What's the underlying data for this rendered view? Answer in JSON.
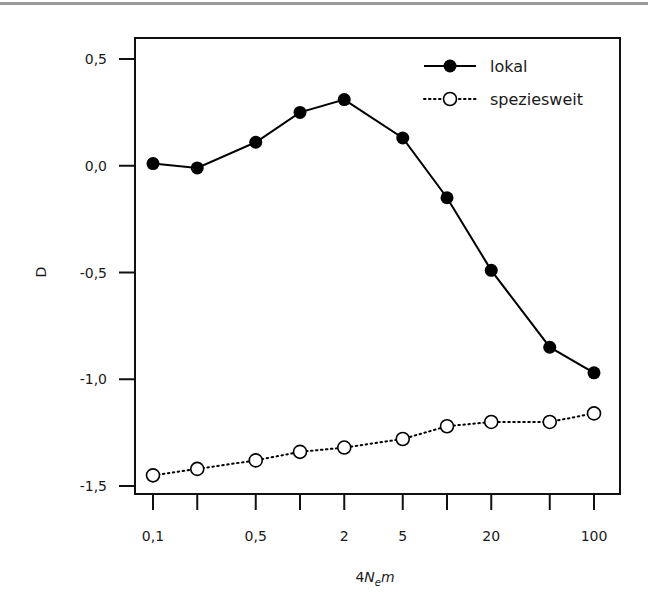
{
  "chart_data": {
    "type": "line",
    "title": "",
    "xlabel": "4N_e m",
    "xlabel_parts": {
      "prefix": "4",
      "N": "N",
      "sub": "e",
      "suffix": "m"
    },
    "ylabel": "D",
    "x_scale": "log",
    "x": [
      0.1,
      0.2,
      0.5,
      1,
      2,
      5,
      10,
      20,
      50,
      100
    ],
    "x_ticks": [
      0.1,
      0.2,
      0.5,
      1,
      2,
      5,
      10,
      20,
      50,
      100
    ],
    "x_tick_labels": [
      "0,1",
      "",
      "0,5",
      "",
      "2",
      "5",
      "",
      "20",
      "",
      "100"
    ],
    "y_ticks": [
      0.5,
      0.0,
      -0.5,
      -1.0,
      -1.5
    ],
    "y_tick_labels": [
      "0,5",
      "0,0",
      "-0,5",
      "-1,0",
      "-1,5"
    ],
    "ylim": [
      -1.55,
      0.6
    ],
    "grid": false,
    "legend_position": "upper right",
    "series": [
      {
        "name": "lokal",
        "marker": "filled-circle",
        "line": "solid",
        "color": "#000000",
        "values": [
          0.01,
          -0.01,
          0.11,
          0.25,
          0.31,
          0.13,
          -0.15,
          -0.49,
          -0.85,
          -0.97
        ]
      },
      {
        "name": "speziesweit",
        "marker": "open-circle",
        "line": "dotted",
        "color": "#000000",
        "values": [
          -1.45,
          -1.42,
          -1.38,
          -1.34,
          -1.32,
          -1.28,
          -1.22,
          -1.2,
          -1.2,
          -1.16
        ]
      }
    ]
  },
  "legend": {
    "items": [
      {
        "label": "lokal"
      },
      {
        "label": "speziesweit"
      }
    ]
  }
}
